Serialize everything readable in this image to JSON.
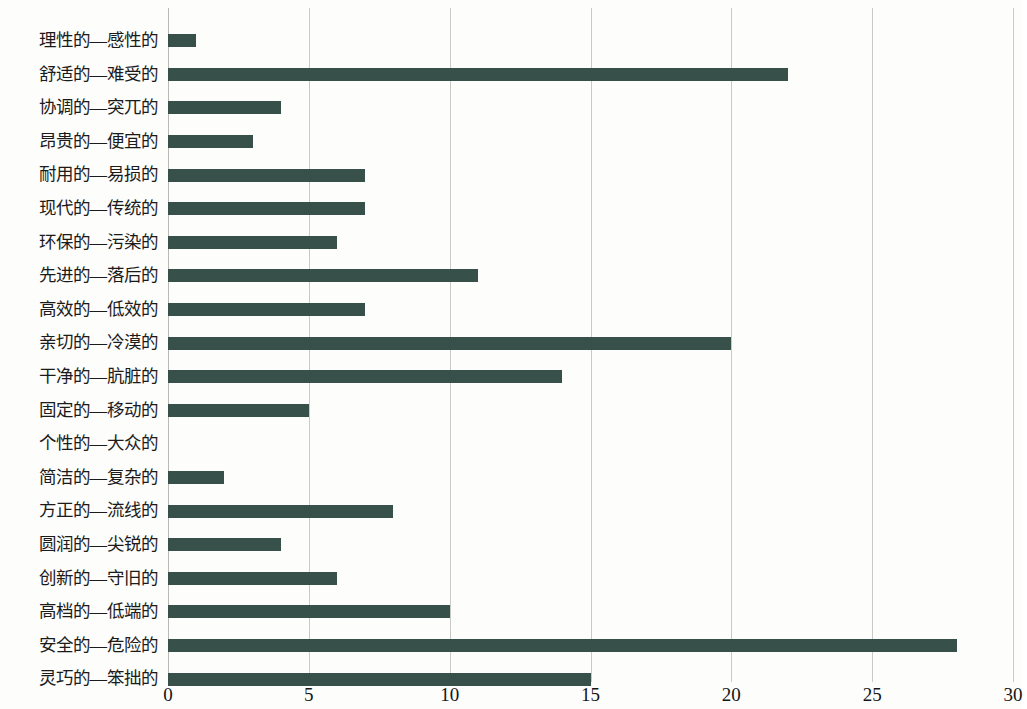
{
  "chart_data": {
    "type": "bar",
    "orientation": "horizontal",
    "title": "",
    "subtitle": "",
    "xlabel": "",
    "ylabel": "",
    "xlim": [
      0,
      30
    ],
    "xticks": [
      0,
      5,
      10,
      15,
      20,
      25,
      30
    ],
    "xtick_labels": [
      "0",
      "5",
      "10",
      "15",
      "20",
      "25",
      "30"
    ],
    "grid": true,
    "legend": false,
    "legend_position": "none",
    "series_color": "#37514a",
    "categories": [
      "理性的—感性的",
      "舒适的—难受的",
      "协调的—突兀的",
      "昂贵的—便宜的",
      "耐用的—易损的",
      "现代的—传统的",
      "环保的—污染的",
      "先进的—落后的",
      "高效的—低效的",
      "亲切的—冷漠的",
      "干净的—肮脏的",
      "固定的—移动的",
      "个性的—大众的",
      "简洁的—复杂的",
      "方正的—流线的",
      "圆润的—尖锐的",
      "创新的—守旧的",
      "高档的—低端的",
      "安全的—危险的",
      "灵巧的—笨拙的"
    ],
    "values": [
      1,
      22,
      4,
      3,
      7,
      7,
      6,
      11,
      7,
      20,
      14,
      5,
      0,
      2,
      8,
      4,
      6,
      10,
      28,
      15
    ]
  }
}
